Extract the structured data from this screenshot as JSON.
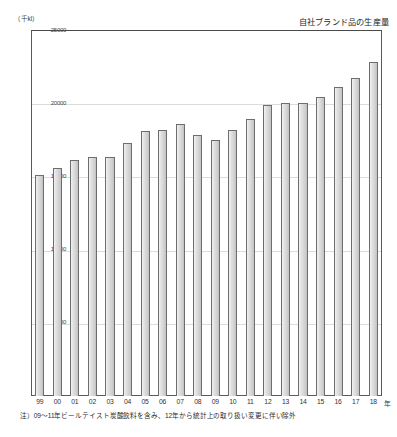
{
  "chart_data": {
    "type": "bar",
    "title": "自社ブランド品の生産量",
    "unit_label": "（千kl）",
    "xlabel": "年",
    "ylabel": "",
    "ylim": [
      0,
      25000
    ],
    "grid": true,
    "legend": "none",
    "categories": [
      "99",
      "00",
      "01",
      "02",
      "03",
      "04",
      "05",
      "06",
      "07",
      "08",
      "09",
      "10",
      "11",
      "12",
      "13",
      "14",
      "15",
      "16",
      "17",
      "18"
    ],
    "values": [
      15100,
      15600,
      16100,
      16300,
      16350,
      17300,
      18100,
      18200,
      18600,
      17800,
      17500,
      18200,
      18900,
      19900,
      20000,
      20000,
      20400,
      21100,
      21700,
      22800
    ],
    "ytick_labels": [
      "25000",
      "20000",
      "15000",
      "10000",
      "5000"
    ],
    "ytick_values": [
      25000,
      20000,
      15000,
      10000,
      5000
    ],
    "note": "注）09～11年ビールテイスト炭酸飲料を含み、12年から統計上の取り扱い変更に伴い除外"
  }
}
